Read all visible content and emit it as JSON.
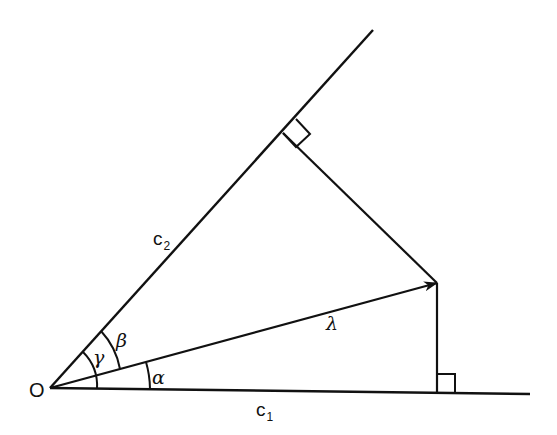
{
  "diagram": {
    "type": "vector-projection",
    "colors": {
      "stroke": "#111111",
      "background": "#ffffff"
    },
    "points": {
      "origin": {
        "x": 50,
        "y": 388
      },
      "c1_end": {
        "x": 530,
        "y": 394
      },
      "c2_end": {
        "x": 373,
        "y": 30
      },
      "lambda_tip": {
        "x": 437,
        "y": 283
      },
      "foot_c2": {
        "x": 283,
        "y": 133
      },
      "foot_c1": {
        "x": 437,
        "y": 393
      }
    },
    "labels": {
      "origin": "O",
      "c1_main": "c",
      "c1_sub": "1",
      "c2_main": "c",
      "c2_sub": "2",
      "lambda": "λ",
      "alpha": "α",
      "beta": "β",
      "gamma": "γ"
    }
  }
}
